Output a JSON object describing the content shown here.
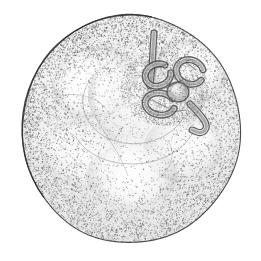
{
  "image": {
    "title": "Stipple illustration of a globular fruit viewed from the calyx end",
    "medium": "pen-and-ink stipple drawing",
    "palette": "grayscale",
    "width": 261,
    "height": 261,
    "background_color": "#ffffff",
    "outline_color": "#4a4a4a",
    "ink_color": "#3a3a3a",
    "midtone_color": "#9a9a9a",
    "highlight_color": "#fdfdfd",
    "has_text_labels": false,
    "has_scale_bar": false,
    "has_border": false
  },
  "body": {
    "name": "fruit-body",
    "shape": "circle",
    "center_x": 131,
    "center_y": 129,
    "radius_x": 109,
    "radius_y": 114,
    "rim_line_width": 1.1,
    "fill_top": "#f4f4f4",
    "fill_bottom": "#e6e6e6",
    "stipple_density_rim": 0.72,
    "stipple_density_center": 0.14
  },
  "highlights": [
    {
      "name": "upper-left-highlight",
      "cx": 78,
      "cy": 86,
      "rx": 36,
      "ry": 30,
      "strength": 0.95
    },
    {
      "name": "upper-right-highlight",
      "cx": 196,
      "cy": 70,
      "rx": 30,
      "ry": 26,
      "strength": 0.88
    },
    {
      "name": "lower-center-highlight",
      "cx": 128,
      "cy": 170,
      "rx": 44,
      "ry": 32,
      "strength": 0.92
    },
    {
      "name": "left-flank-highlight",
      "cx": 55,
      "cy": 142,
      "rx": 24,
      "ry": 30,
      "strength": 0.7
    },
    {
      "name": "right-flank-highlight",
      "cx": 206,
      "cy": 140,
      "rx": 24,
      "ry": 28,
      "strength": 0.66
    }
  ],
  "lobes": [
    {
      "name": "lobe-upper-left",
      "cx": 95,
      "cy": 82,
      "rx": 44,
      "ry": 36,
      "rot": -18
    },
    {
      "name": "lobe-upper-right",
      "cx": 190,
      "cy": 72,
      "rx": 38,
      "ry": 32,
      "rot": 14
    },
    {
      "name": "lobe-lower-left",
      "cx": 82,
      "cy": 154,
      "rx": 42,
      "ry": 34,
      "rot": 12
    },
    {
      "name": "lobe-lower-right",
      "cx": 183,
      "cy": 148,
      "rx": 40,
      "ry": 34,
      "rot": -10
    },
    {
      "name": "lobe-bottom-center",
      "cx": 132,
      "cy": 176,
      "rx": 46,
      "ry": 30,
      "rot": 0
    }
  ],
  "calyx_depression": {
    "name": "stem-scar-depression",
    "cx": 146,
    "cy": 96,
    "rx": 58,
    "ry": 46,
    "rim_shadow": "#b6b6b6"
  },
  "embryo": {
    "name": "coiled-stem-scar",
    "description": "coiled tubular calyx remnant with a vertical stalk and a hooked trailing tail",
    "cx": 172,
    "cy": 84,
    "parts": [
      {
        "name": "vertical-stalk",
        "x1": 154,
        "y1": 33,
        "x2": 150,
        "y2": 86
      },
      {
        "name": "upper-loop-left",
        "cx": 158,
        "cy": 75,
        "rx": 13,
        "ry": 11
      },
      {
        "name": "upper-loop-right",
        "cx": 190,
        "cy": 72,
        "rx": 14,
        "ry": 12
      },
      {
        "name": "central-knob",
        "cx": 178,
        "cy": 92,
        "rx": 11,
        "ry": 10
      },
      {
        "name": "lower-loop",
        "cx": 160,
        "cy": 104,
        "rx": 15,
        "ry": 11
      },
      {
        "name": "hooked-tail",
        "x1": 190,
        "y1": 104,
        "x2": 208,
        "y2": 134
      }
    ]
  },
  "chart_data": {
    "type": "scatter",
    "xlabel": "normalized radius from center",
    "ylabel": "relative ink density",
    "x": [
      0.0,
      0.15,
      0.3,
      0.45,
      0.6,
      0.75,
      0.9,
      1.0
    ],
    "values": [
      0.12,
      0.14,
      0.2,
      0.3,
      0.42,
      0.56,
      0.7,
      0.74
    ],
    "xlim": [
      0,
      1
    ],
    "ylim": [
      0,
      1
    ],
    "grid": false,
    "legend": "none"
  }
}
